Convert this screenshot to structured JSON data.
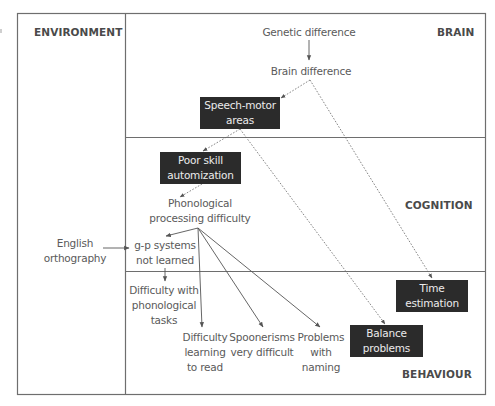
{
  "diagram": {
    "colors": {
      "frame": "#6e6e6e",
      "box_fill": "#2b2b2b",
      "box_text": "#ececec",
      "text": "#5a5a5a",
      "arrow": "#555555"
    },
    "zones": {
      "environment": "ENVIRONMENT",
      "brain": "BRAIN",
      "cognition": "COGNITION",
      "behaviour": "BEHAVIOUR"
    },
    "nodes": {
      "genetic_difference": "Genetic difference",
      "brain_difference": "Brain difference",
      "speech_motor": {
        "line1": "Speech-motor",
        "line2": "areas"
      },
      "poor_skill": {
        "line1": "Poor skill",
        "line2": "automization"
      },
      "phonological": {
        "line1": "Phonological",
        "line2": "processing difficulty"
      },
      "english": {
        "line1": "English",
        "line2": "orthography"
      },
      "gp_systems": {
        "line1": "g-p systems",
        "line2": "not learned"
      },
      "phon_tasks": {
        "line1": "Difficulty with",
        "line2": "phonological",
        "line3": "tasks"
      },
      "learning_read": {
        "line1": "Difficulty",
        "line2": "learning",
        "line3": "to read"
      },
      "spoonerisms": {
        "line1": "Spoonerisms",
        "line2": "very difficult"
      },
      "naming": {
        "line1": "Problems",
        "line2": "with",
        "line3": "naming"
      },
      "time_estimation": {
        "line1": "Time",
        "line2": "estimation"
      },
      "balance": {
        "line1": "Balance",
        "line2": "problems"
      }
    },
    "edges": [
      {
        "from": "genetic_difference",
        "to": "brain_difference",
        "style": "solid"
      },
      {
        "from": "brain_difference",
        "to": "speech_motor",
        "style": "dotted"
      },
      {
        "from": "brain_difference",
        "to": "time_estimation",
        "style": "dotted"
      },
      {
        "from": "speech_motor",
        "to": "poor_skill",
        "style": "dotted"
      },
      {
        "from": "speech_motor",
        "to": "balance",
        "style": "dotted"
      },
      {
        "from": "poor_skill",
        "to": "phonological",
        "style": "dotted"
      },
      {
        "from": "english",
        "to": "gp_systems",
        "style": "solid"
      },
      {
        "from": "phonological",
        "to": "gp_systems",
        "style": "solid"
      },
      {
        "from": "phonological",
        "to": "learning_read",
        "style": "solid"
      },
      {
        "from": "phonological",
        "to": "spoonerisms",
        "style": "solid"
      },
      {
        "from": "phonological",
        "to": "naming",
        "style": "solid"
      },
      {
        "from": "gp_systems",
        "to": "phon_tasks",
        "style": "solid"
      }
    ]
  }
}
